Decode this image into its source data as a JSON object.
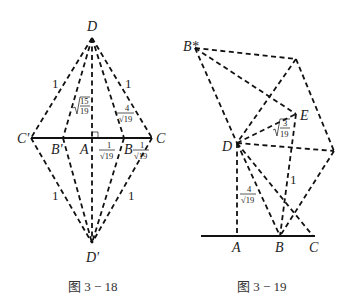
{
  "figure_left": {
    "caption": "图 3 − 18",
    "points": {
      "D": "D",
      "D_prime": "D'",
      "C_prime": "C'",
      "B_prime": "B'",
      "A": "A",
      "B": "B",
      "C": "C"
    },
    "edge_labels": {
      "upper_left": "1",
      "upper_right": "1",
      "lower_left": "1",
      "lower_right": "1",
      "DA_num": "15",
      "DA_den": "19",
      "DB_num": "4",
      "DB_den": "√19",
      "AB_num": "1",
      "AB_den": "√19",
      "BC_num": "1",
      "BC_den": "√19"
    }
  },
  "figure_right": {
    "caption": "图 3 − 19",
    "points": {
      "B_star": "B*",
      "E": "E",
      "D": "D",
      "A": "A",
      "B": "B",
      "C": "C"
    },
    "edge_labels": {
      "DE_num": "3",
      "DE_den": "19",
      "DA_num": "4",
      "DA_den": "√19",
      "EB": "1"
    }
  }
}
